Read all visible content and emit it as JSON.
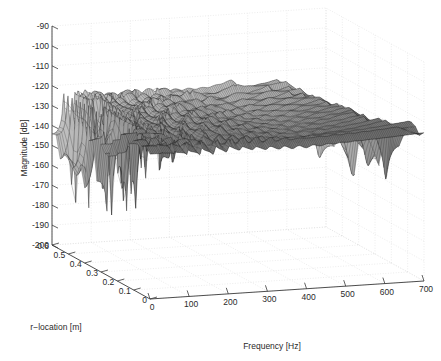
{
  "figure": {
    "background_color": "#ffffff",
    "axis_color": "#3a3a3a",
    "grid_color": "#d8d8d8",
    "mesh_color": "#1a1a1a",
    "surface_fill": "#6e6e6e"
  },
  "chart_data": {
    "type": "line",
    "plot_style": "3d-mesh-waterfall",
    "title": "",
    "subtitle": "",
    "xlabel": "Frequency [Hz]",
    "ylabel": "r-location [m]",
    "zlabel": "Magnitude [dB]",
    "grid": true,
    "legend": null,
    "xlim": [
      0,
      700
    ],
    "ylim": [
      0,
      0.6
    ],
    "zlim": [
      -200,
      -90
    ],
    "xticks": [
      0,
      100,
      200,
      300,
      400,
      500,
      600,
      700
    ],
    "xticklabels": [
      "0",
      "100",
      "200",
      "300",
      "400",
      "500",
      "600",
      "700"
    ],
    "yticks": [
      0,
      0.1,
      0.2,
      0.3,
      0.4,
      0.5,
      0.6
    ],
    "yticklabels": [
      "0",
      "0.1",
      "0.2",
      "0.3",
      "0.4",
      "0.5",
      "0.6"
    ],
    "zticks": [
      -200,
      -190,
      -180,
      -170,
      -160,
      -150,
      -140,
      -130,
      -120,
      -110,
      -100,
      -90
    ],
    "zticklabels": [
      "-200",
      "-190",
      "-180",
      "-170",
      "-160",
      "-150",
      "-140",
      "-130",
      "-120",
      "-110",
      "-100",
      "-90"
    ],
    "view": {
      "azimuth": -37.5,
      "elevation": 30
    },
    "resonance_peaks_hz": [
      30,
      62,
      95,
      128,
      162,
      196,
      230,
      264,
      298,
      332,
      366,
      400,
      434,
      468,
      502,
      536,
      570,
      604,
      638,
      672
    ],
    "peak_magnitudes_db": [
      -146,
      -141,
      -134,
      -130,
      -128,
      -131,
      -134,
      -133,
      -130,
      -128,
      -126,
      -125,
      -127,
      -130,
      -133,
      -136,
      -140,
      -145,
      -152,
      -162
    ],
    "notch_floor_db": -205,
    "series": [
      {
        "name": "r = 0.00 m",
        "r": 0.0
      },
      {
        "name": "r = 0.05 m",
        "r": 0.05
      },
      {
        "name": "r = 0.10 m",
        "r": 0.1
      },
      {
        "name": "r = 0.15 m",
        "r": 0.15
      },
      {
        "name": "r = 0.20 m",
        "r": 0.2
      },
      {
        "name": "r = 0.25 m",
        "r": 0.25
      },
      {
        "name": "r = 0.30 m",
        "r": 0.3
      },
      {
        "name": "r = 0.35 m",
        "r": 0.35
      },
      {
        "name": "r = 0.40 m",
        "r": 0.4
      },
      {
        "name": "r = 0.45 m",
        "r": 0.45
      },
      {
        "name": "r = 0.50 m",
        "r": 0.5
      },
      {
        "name": "r = 0.55 m",
        "r": 0.55
      },
      {
        "name": "r = 0.60 m",
        "r": 0.6
      }
    ]
  }
}
